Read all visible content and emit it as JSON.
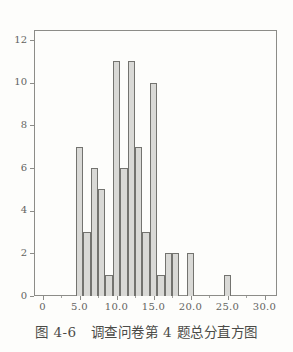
{
  "figure": {
    "caption_label": "图 4-6",
    "caption_text": "调查问卷第 4 题总分直方图"
  },
  "chart_data": {
    "type": "bar",
    "subtype": "histogram",
    "title": "",
    "xlabel": "",
    "ylabel": "",
    "xlim": [
      -1,
      31.7
    ],
    "ylim": [
      0,
      12.5
    ],
    "grid": false,
    "legend": null,
    "bin_width": 1,
    "bars": [
      {
        "x": 5,
        "count": 7
      },
      {
        "x": 6,
        "count": 3
      },
      {
        "x": 7,
        "count": 6
      },
      {
        "x": 8,
        "count": 5
      },
      {
        "x": 9,
        "count": 1
      },
      {
        "x": 10,
        "count": 11
      },
      {
        "x": 11,
        "count": 6
      },
      {
        "x": 12,
        "count": 11
      },
      {
        "x": 13,
        "count": 7
      },
      {
        "x": 14,
        "count": 3
      },
      {
        "x": 15,
        "count": 10
      },
      {
        "x": 16,
        "count": 1
      },
      {
        "x": 17,
        "count": 2
      },
      {
        "x": 18,
        "count": 2
      },
      {
        "x": 20,
        "count": 2
      },
      {
        "x": 25,
        "count": 1
      }
    ],
    "x_axis": {
      "major_ticks": [
        0,
        5,
        10,
        15,
        20,
        25,
        30
      ],
      "major_labels": [
        "0",
        "5.0",
        "10.0",
        "15.0",
        "20.0",
        "25.0",
        "30.0"
      ],
      "minor_ticks": [
        2.5,
        7.5,
        12.5,
        17.5,
        22.5,
        27.5
      ]
    },
    "y_axis": {
      "major_ticks": [
        0,
        2,
        4,
        6,
        8,
        10,
        12
      ],
      "major_labels": [
        "0",
        "2",
        "4",
        "6",
        "8",
        "10",
        "12"
      ]
    },
    "colors": {
      "bar_fill": "#d9d9d6",
      "bar_edge": "#73736f",
      "axis": "#8c8c88",
      "tick_label": "#63635f",
      "caption": "#4b4b47",
      "background": "#fdfdfb"
    }
  }
}
